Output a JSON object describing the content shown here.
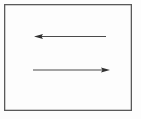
{
  "figure": {
    "canvas": {
      "width": 141,
      "height": 119,
      "background_color": "#fdfdfd"
    },
    "frame": {
      "name": "rectangle-border",
      "x": 4,
      "y": 4,
      "width": 128,
      "height": 107,
      "stroke_color": "#5a5a5a",
      "stroke_width": 1.3,
      "fill": "none"
    },
    "arrows": [
      {
        "name": "leftward-arrow",
        "direction": "left",
        "label": "",
        "tail_x": 106,
        "tail_y": 36.5,
        "head_x": 34,
        "head_y": 36.5,
        "stroke_color": "#4a4a4a",
        "stroke_width": 1.1,
        "head_length": 9,
        "head_width": 5
      },
      {
        "name": "rightward-arrow",
        "direction": "right",
        "label": "",
        "tail_x": 33,
        "tail_y": 70,
        "head_x": 110,
        "head_y": 70,
        "stroke_color": "#4a4a4a",
        "stroke_width": 1.1,
        "head_length": 9,
        "head_width": 5
      }
    ]
  }
}
